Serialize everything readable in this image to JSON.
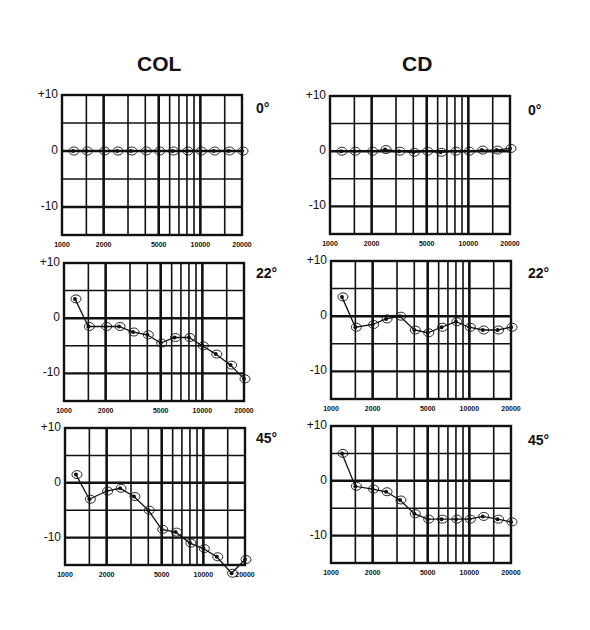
{
  "titles": {
    "left": "COL",
    "right": "CD"
  },
  "angles": [
    "0°",
    "22°",
    "45°"
  ],
  "y_tick_labels": [
    "+10",
    "0",
    "-10"
  ],
  "x_tick_labels": [
    "1000",
    "2000",
    "5000",
    "10000",
    "20000"
  ],
  "colors": {
    "ink": "#111111",
    "background": "#ffffff"
  },
  "chart_data": [
    {
      "type": "line",
      "title": "COL 0°",
      "xlabel": "Frequency (Hz)",
      "ylabel": "dB",
      "xscale": "log",
      "xlim": [
        1000,
        20000
      ],
      "ylim": [
        -15,
        10
      ],
      "grid": true,
      "x": [
        1200,
        1500,
        2000,
        2500,
        3150,
        4000,
        5000,
        6300,
        8000,
        10000,
        12500,
        16000,
        20000
      ],
      "series": [
        {
          "name": "COL 0°",
          "values": [
            0,
            0,
            0,
            0,
            0,
            0,
            0,
            0,
            0,
            0,
            0,
            0,
            0
          ]
        }
      ]
    },
    {
      "type": "line",
      "title": "CD 0°",
      "xlabel": "Frequency (Hz)",
      "ylabel": "dB",
      "xscale": "log",
      "xlim": [
        1000,
        20000
      ],
      "ylim": [
        -15,
        10
      ],
      "grid": true,
      "x": [
        1200,
        1500,
        2000,
        2500,
        3150,
        4000,
        5000,
        6300,
        8000,
        10000,
        12500,
        16000,
        20000
      ],
      "series": [
        {
          "name": "CD 0°",
          "values": [
            0,
            0,
            0,
            0.3,
            0,
            -0.2,
            0,
            -0.2,
            0,
            0,
            0.2,
            0.2,
            0.5
          ]
        }
      ]
    },
    {
      "type": "line",
      "title": "COL 22°",
      "xlabel": "Frequency (Hz)",
      "ylabel": "dB",
      "xscale": "log",
      "xlim": [
        1000,
        20000
      ],
      "ylim": [
        -15,
        10
      ],
      "grid": true,
      "x": [
        1200,
        1500,
        2000,
        2500,
        3150,
        4000,
        5000,
        6300,
        8000,
        10000,
        12500,
        16000,
        20000
      ],
      "series": [
        {
          "name": "COL 22°",
          "values": [
            3.5,
            -1.5,
            -1.5,
            -1.5,
            -2.5,
            -3,
            -4.5,
            -3.5,
            -3.5,
            -5,
            -6.5,
            -8.5,
            -11
          ]
        }
      ]
    },
    {
      "type": "line",
      "title": "CD 22°",
      "xlabel": "Frequency (Hz)",
      "ylabel": "dB",
      "xscale": "log",
      "xlim": [
        1000,
        20000
      ],
      "ylim": [
        -15,
        10
      ],
      "grid": true,
      "x": [
        1200,
        1500,
        2000,
        2500,
        3150,
        4000,
        5000,
        6300,
        8000,
        10000,
        12500,
        16000,
        20000
      ],
      "series": [
        {
          "name": "CD 22°",
          "values": [
            3.5,
            -2,
            -1.5,
            -0.5,
            0,
            -2.5,
            -3,
            -2,
            -1,
            -2,
            -2.5,
            -2.5,
            -2
          ]
        }
      ]
    },
    {
      "type": "line",
      "title": "COL 45°",
      "xlabel": "Frequency (Hz)",
      "ylabel": "dB",
      "xscale": "log",
      "xlim": [
        1000,
        20000
      ],
      "ylim": [
        -15,
        10
      ],
      "grid": true,
      "x": [
        1200,
        1500,
        2000,
        2500,
        3150,
        4000,
        5000,
        6300,
        8000,
        10000,
        12500,
        16000,
        20000
      ],
      "series": [
        {
          "name": "COL 45°",
          "values": [
            1.5,
            -3,
            -1.5,
            -1,
            -2.5,
            -5,
            -8.5,
            -9,
            -11,
            -12,
            -13.5,
            -16.5,
            -14
          ]
        }
      ]
    },
    {
      "type": "line",
      "title": "CD 45°",
      "xlabel": "Frequency (Hz)",
      "ylabel": "dB",
      "xscale": "log",
      "xlim": [
        1000,
        20000
      ],
      "ylim": [
        -15,
        10
      ],
      "grid": true,
      "x": [
        1200,
        1500,
        2000,
        2500,
        3150,
        4000,
        5000,
        6300,
        8000,
        10000,
        12500,
        16000,
        20000
      ],
      "series": [
        {
          "name": "CD 45°",
          "values": [
            5,
            -1,
            -1.5,
            -2,
            -3.5,
            -6,
            -7,
            -7,
            -7,
            -7,
            -6.5,
            -7,
            -7.5
          ]
        }
      ]
    }
  ]
}
